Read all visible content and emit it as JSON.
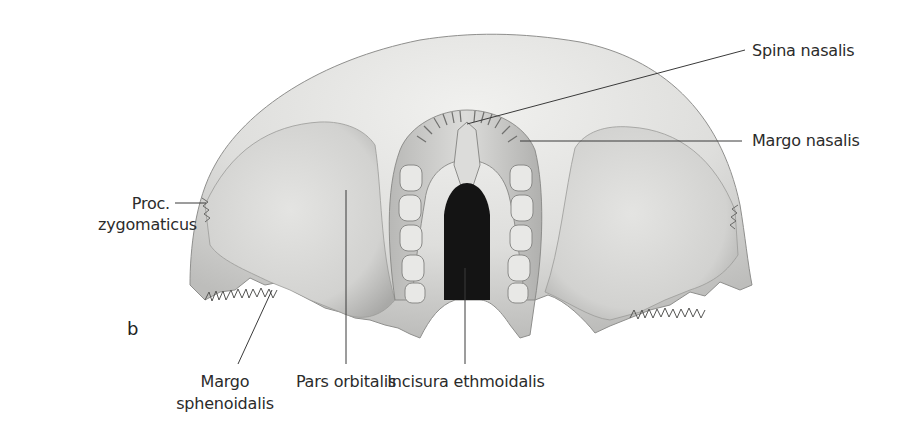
{
  "figure": {
    "panel_letter": "b",
    "labels": [
      {
        "id": "spina-nasalis",
        "text": "Spina nasalis"
      },
      {
        "id": "margo-nasalis",
        "text": "Margo nasalis"
      },
      {
        "id": "proc-zygomaticus",
        "lines": [
          "Proc.",
          "zygomaticus"
        ]
      },
      {
        "id": "margo-sphenoidalis",
        "lines": [
          "Margo",
          "sphenoidalis"
        ]
      },
      {
        "id": "pars-orbitalis",
        "text": "Pars orbitalis"
      },
      {
        "id": "incisura-ethmoidalis",
        "text": "Incisura ethmoidalis"
      }
    ],
    "colors": {
      "background": "#ffffff",
      "bone_light": "#e6e6e4",
      "bone_mid": "#c9c9c7",
      "bone_dark": "#8e8e8c",
      "notch": "#141414",
      "leader_line": "#3a3a3a",
      "label_text": "#2b2b2b"
    }
  }
}
